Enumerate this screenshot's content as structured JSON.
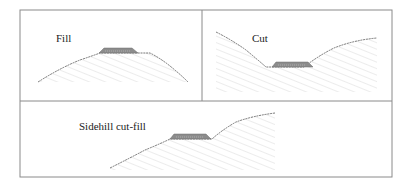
{
  "panels": [
    {
      "id": "fill",
      "label": "Fill"
    },
    {
      "id": "cut",
      "label": "Cut"
    },
    {
      "id": "sidehill",
      "label": "Sidehill cut-fill"
    }
  ],
  "colors": {
    "border": "#8a8a8a",
    "ground_line": "#555555",
    "hatch": "#d6d6d6",
    "pavement": "#8c8c8c",
    "pavement_highlight": "#bdbdbd"
  }
}
